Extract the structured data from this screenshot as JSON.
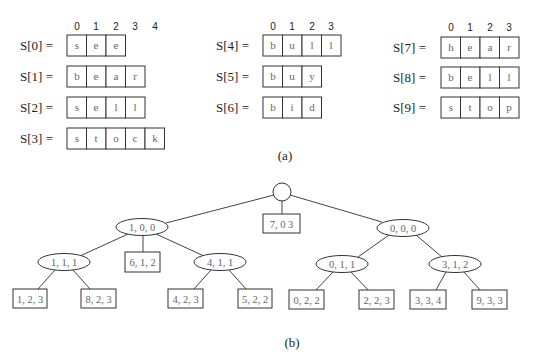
{
  "figure": {
    "part_a": {
      "caption": "(a)",
      "columns": [
        {
          "index_labels": [
            "0",
            "1",
            "2",
            "3",
            "4"
          ],
          "arrays": [
            {
              "name": "S[0] =",
              "chars": [
                "s",
                "e",
                "e"
              ]
            },
            {
              "name": "S[1] =",
              "chars": [
                "b",
                "e",
                "a",
                "r"
              ]
            },
            {
              "name": "S[2] =",
              "chars": [
                "s",
                "e",
                "l",
                "l"
              ]
            },
            {
              "name": "S[3] =",
              "chars": [
                "s",
                "t",
                "o",
                "c",
                "k"
              ]
            }
          ]
        },
        {
          "index_labels": [
            "0",
            "1",
            "2",
            "3"
          ],
          "arrays": [
            {
              "name": "S[4] =",
              "chars": [
                "b",
                "u",
                "l",
                "l"
              ]
            },
            {
              "name": "S[5] =",
              "chars": [
                "b",
                "u",
                "y"
              ]
            },
            {
              "name": "S[6] =",
              "chars": [
                "b",
                "i",
                "d"
              ]
            }
          ]
        },
        {
          "index_labels": [
            "0",
            "1",
            "2",
            "3"
          ],
          "arrays": [
            {
              "name": "S[7] =",
              "chars": [
                "h",
                "e",
                "a",
                "r"
              ]
            },
            {
              "name": "S[8] =",
              "chars": [
                "b",
                "e",
                "l",
                "l"
              ]
            },
            {
              "name": "S[9] =",
              "chars": [
                "s",
                "t",
                "o",
                "p"
              ]
            }
          ]
        }
      ]
    },
    "part_b": {
      "caption": "(b)",
      "tree": {
        "root": {
          "label": ""
        },
        "internal_nodes": [
          {
            "id": "n100",
            "label": "1, 0, 0"
          },
          {
            "id": "n000",
            "label": "0, 0, 0"
          },
          {
            "id": "n111",
            "label": "1, 1, 1"
          },
          {
            "id": "n411",
            "label": "4, 1, 1"
          },
          {
            "id": "n011",
            "label": "0, 1, 1"
          },
          {
            "id": "n312",
            "label": "3, 1, 2"
          }
        ],
        "leaves": [
          {
            "id": "l703",
            "label": "7, 0 3"
          },
          {
            "id": "l612",
            "label": "6, 1, 2"
          },
          {
            "id": "l123",
            "label": "1, 2, 3"
          },
          {
            "id": "l823",
            "label": "8, 2, 3"
          },
          {
            "id": "l423",
            "label": "4, 2, 3"
          },
          {
            "id": "l522",
            "label": "5, 2, 2"
          },
          {
            "id": "l022",
            "label": "0, 2, 2"
          },
          {
            "id": "l223",
            "label": "2, 2, 3"
          },
          {
            "id": "l334",
            "label": "3, 3, 4"
          },
          {
            "id": "l933",
            "label": "9, 3, 3"
          }
        ]
      }
    }
  }
}
